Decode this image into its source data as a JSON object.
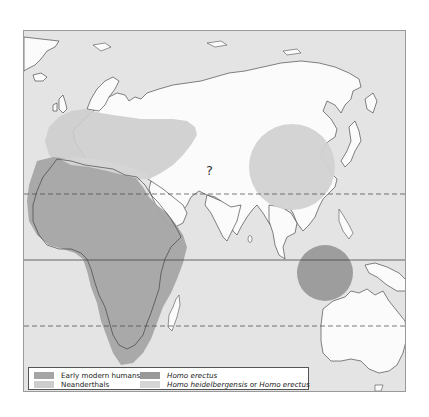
{
  "map": {
    "colors": {
      "ocean": "#e4e4e4",
      "land": "#fbfbfb",
      "early_modern_humans": "#a5a5a5",
      "neanderthals": "#cdcdcd",
      "homo_erectus": "#999999",
      "homo_heidelbergensis_or_erectus": "#d5d5d5",
      "coastline": "#333333",
      "frame": "#9a9a9a"
    },
    "annotations": [
      {
        "id": "uncertain-region",
        "text": "?"
      }
    ],
    "reference_lines": [
      {
        "name": "tropic-of-cancer",
        "style": "dashed"
      },
      {
        "name": "equator",
        "style": "solid"
      },
      {
        "name": "tropic-of-capricorn",
        "style": "dashed"
      }
    ],
    "regions": [
      {
        "name": "Africa",
        "group": "Early modern humans"
      },
      {
        "name": "Europe and Western Asia",
        "group": "Neanderthals"
      },
      {
        "name": "North Africa coast",
        "group": "Homo heidelbergensis or Homo erectus"
      },
      {
        "name": "East Asia",
        "group": "Homo heidelbergensis or Homo erectus"
      },
      {
        "name": "Java / Indonesia",
        "group": "Homo erectus"
      }
    ]
  },
  "legend": {
    "items": [
      {
        "label": "Early modern humans",
        "italic": false,
        "color": "#a5a5a5"
      },
      {
        "label": "Homo erectus",
        "italic": true,
        "color": "#999999"
      },
      {
        "label": "Neanderthals",
        "italic": false,
        "color": "#cdcdcd"
      },
      {
        "label": "Homo heidelbergensis",
        "italic": true,
        "color": "#d5d5d5"
      }
    ],
    "heidelbergensis_label": {
      "part1": "Homo heidelbergensis",
      "connector": " or ",
      "part2": "Homo erectus"
    }
  }
}
